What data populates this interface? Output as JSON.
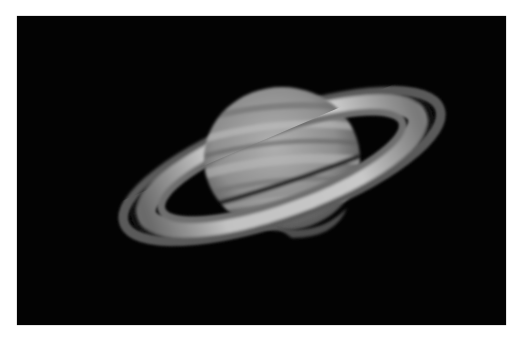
{
  "image": {
    "subject": "Saturn with rings",
    "alt": "Telescope photograph of the planet Saturn showing its banded globe and tilted ring system against a black sky",
    "colors": {
      "background": "#ffffff",
      "sky": "#030303",
      "ring_bright": "#bdbdbd",
      "globe": "#9a9a9a"
    }
  }
}
